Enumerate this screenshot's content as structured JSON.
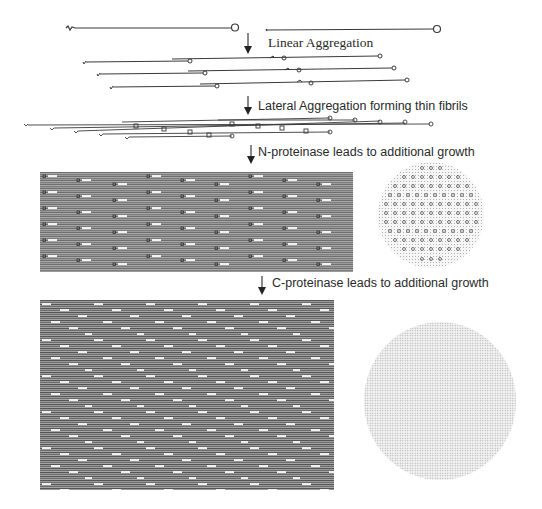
{
  "diagram": {
    "title": "",
    "steps": [
      {
        "id": "linear",
        "label": "Linear Aggregation"
      },
      {
        "id": "lateral",
        "label": "Lateral Aggregation forming thin fibrils"
      },
      {
        "id": "n-proteinase",
        "label": "N-proteinase leads to additional growth"
      },
      {
        "id": "c-proteinase",
        "label": "C-proteinase leads to additional growth"
      }
    ],
    "stages": [
      {
        "id": "monomers",
        "description": "Two single collagen molecules with N-terminal squiggle and C-terminal circle"
      },
      {
        "id": "linear-aggregates",
        "description": "Three staggered end-to-end overlapping molecule pairs"
      },
      {
        "id": "thin-fibril",
        "description": "Laterally aggregated thin fibril with staggered molecules"
      },
      {
        "id": "n-processed-fibril",
        "description": "Larger fibril bundle (longitudinal view) with circular cross-section showing hexagonal packing"
      },
      {
        "id": "c-processed-fibril",
        "description": "Large mature fibril bundle (longitudinal view) with dense circular cross-section"
      }
    ],
    "colors": {
      "line": "#3a3a3a",
      "text": "#2a2a2a",
      "bundle": "#8a8a8a",
      "background": "#ffffff"
    }
  }
}
